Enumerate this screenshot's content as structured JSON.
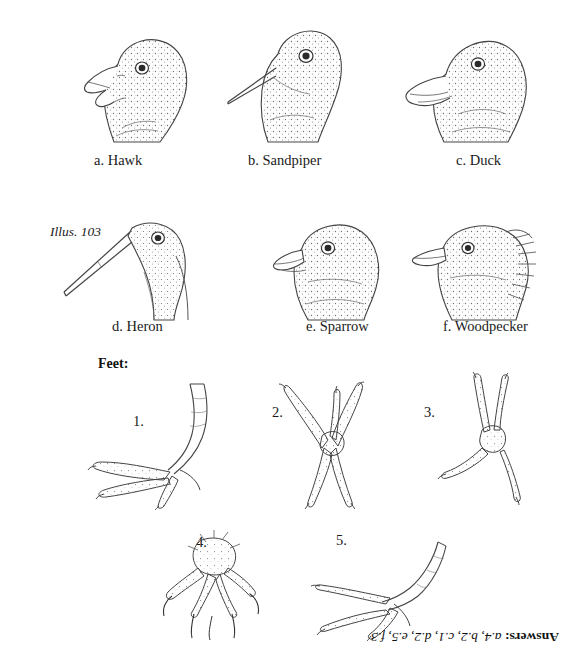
{
  "document": {
    "illustration_label": "Illus. 103",
    "feet_heading": "Feet:",
    "answers_prefix": "Answers:",
    "answers_text": "a.4, b.2, c.1, d.2, e.5, f.3"
  },
  "heads": [
    {
      "caption": "a. Hawk"
    },
    {
      "caption": "b. Sandpiper"
    },
    {
      "caption": "c. Duck"
    },
    {
      "caption": "d. Heron"
    },
    {
      "caption": "e. Sparrow"
    },
    {
      "caption": "f. Woodpecker"
    }
  ],
  "feet": [
    {
      "number": "1."
    },
    {
      "number": "2."
    },
    {
      "number": "3."
    },
    {
      "number": "4."
    },
    {
      "number": "5."
    }
  ],
  "colors": {
    "ink": "#1a1a1a",
    "line": "#3b3b3b",
    "stipple": "#6b6b6b",
    "paper": "#ffffff"
  }
}
